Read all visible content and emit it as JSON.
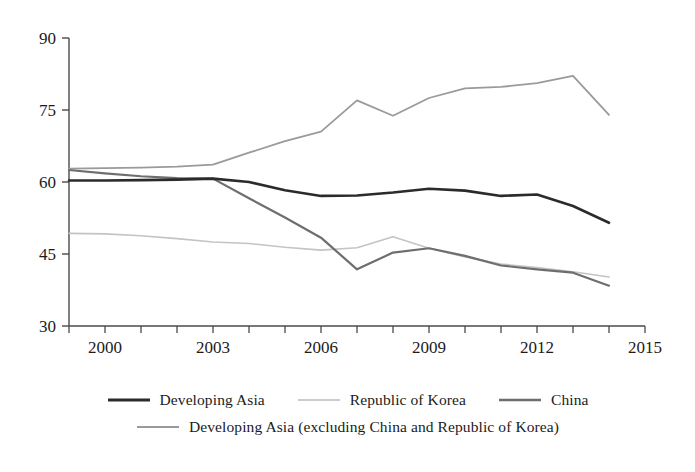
{
  "chart_data": {
    "type": "line",
    "title": "",
    "xlabel": "",
    "ylabel": "",
    "xlim": [
      1999,
      2015
    ],
    "ylim": [
      30,
      90
    ],
    "yticks": [
      30,
      45,
      60,
      75,
      90
    ],
    "xticks": [
      2000,
      2003,
      2006,
      2009,
      2012,
      2015
    ],
    "xtick_minor_every": 1,
    "grid": false,
    "legend_position": "bottom",
    "x": [
      1999,
      2000,
      2001,
      2002,
      2003,
      2004,
      2005,
      2006,
      2007,
      2008,
      2009,
      2010,
      2011,
      2012,
      2013,
      2014
    ],
    "series": [
      {
        "name": "Developing Asia",
        "color": "#2b2b2b",
        "width": 2.6,
        "values": [
          60.3,
          60.3,
          60.4,
          60.5,
          60.7,
          60.0,
          58.3,
          57.1,
          57.2,
          57.8,
          58.6,
          58.2,
          57.1,
          57.4,
          55.0,
          51.5
        ]
      },
      {
        "name": "Republic of Korea",
        "color": "#c4c4c4",
        "width": 1.6,
        "values": [
          49.3,
          49.2,
          48.8,
          48.2,
          47.5,
          47.2,
          46.4,
          45.8,
          46.3,
          48.6,
          46.2,
          44.4,
          42.9,
          42.2,
          41.3,
          40.2
        ]
      },
      {
        "name": "China",
        "color": "#6e6e6e",
        "width": 2.2,
        "values": [
          62.5,
          61.8,
          61.2,
          60.8,
          60.7,
          56.6,
          52.6,
          48.4,
          41.8,
          45.3,
          46.2,
          44.6,
          42.6,
          41.8,
          41.1,
          38.4
        ]
      },
      {
        "name": "Developing Asia (excluding China and Republic of Korea)",
        "color": "#9a9a9a",
        "width": 1.8,
        "values": [
          62.8,
          62.9,
          63.0,
          63.2,
          63.6,
          66.1,
          68.5,
          70.5,
          77.0,
          73.8,
          77.5,
          79.5,
          79.8,
          80.6,
          82.1,
          74.0
        ]
      }
    ]
  },
  "axes": {
    "ytick_labels": [
      "90",
      "75",
      "60",
      "45",
      "30"
    ],
    "xtick_labels": [
      "2000",
      "2003",
      "2006",
      "2009",
      "2012",
      "2015"
    ]
  },
  "legend": {
    "row1": [
      {
        "label": "Developing Asia",
        "color": "#2b2b2b",
        "width": 3
      },
      {
        "label": "Republic of Korea",
        "color": "#cccccc",
        "width": 2
      },
      {
        "label": "China",
        "color": "#6e6e6e",
        "width": 2.4
      }
    ],
    "row2": [
      {
        "label": "Developing Asia (excluding China and Republic of Korea)",
        "color": "#9a9a9a",
        "width": 2
      }
    ]
  }
}
